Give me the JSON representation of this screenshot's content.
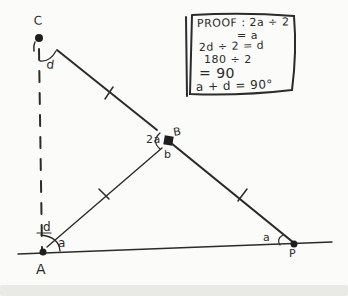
{
  "colors": {
    "ink": "#2b2b2b",
    "paper": "#fbfbf9",
    "footer_strip": "#e9e9e6"
  },
  "proof_box": {
    "lines": [
      "PROOF : 2a ÷ 2",
      "= a",
      "2d ÷ 2 = d",
      "180 ÷ 2",
      "= 90",
      "a + d = 90°"
    ]
  },
  "labels": {
    "point_c": "C",
    "point_a": "A",
    "point_b_upper": "B",
    "point_b_lower": "b",
    "point_p": "P",
    "angle_d_at_c": "d",
    "angle_d_at_a": "d",
    "angle_a_at_a": "a",
    "angle_2a_at_b": "2a",
    "angle_a_at_p": "a"
  }
}
